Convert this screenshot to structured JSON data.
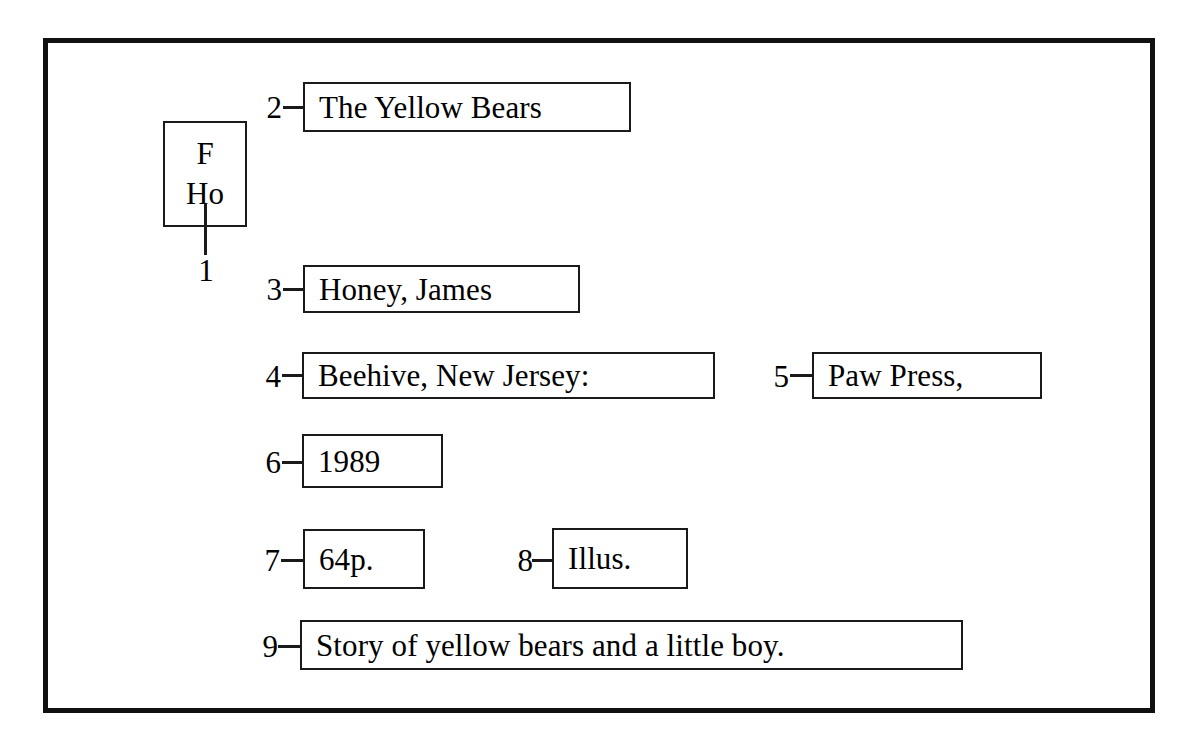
{
  "diagram": {
    "type": "catalog-card-parts",
    "call_number_box": {
      "lines": [
        "F",
        "Ho"
      ],
      "callout": "1"
    },
    "fields": [
      {
        "callout": "2",
        "text": "The Yellow Bears",
        "left": 303,
        "top": 82,
        "width": 328,
        "height": 50,
        "num_left": 252,
        "num_top": 92,
        "dash_left": 283,
        "dash_top": 106,
        "dash_width": 22
      },
      {
        "callout": "3",
        "text": "Honey, James",
        "left": 303,
        "top": 265,
        "width": 277,
        "height": 48,
        "num_left": 252,
        "num_top": 274,
        "dash_left": 283,
        "dash_top": 288,
        "dash_width": 22
      },
      {
        "callout": "4",
        "text": "Beehive, New Jersey:",
        "left": 302,
        "top": 352,
        "width": 413,
        "height": 47,
        "num_left": 251,
        "num_top": 361,
        "dash_left": 282,
        "dash_top": 374,
        "dash_width": 22
      },
      {
        "callout": "5",
        "text": "Paw Press,",
        "left": 812,
        "top": 352,
        "width": 230,
        "height": 47,
        "num_left": 759,
        "num_top": 361,
        "dash_left": 790,
        "dash_top": 374,
        "dash_width": 24
      },
      {
        "callout": "6",
        "text": "1989",
        "left": 302,
        "top": 434,
        "width": 141,
        "height": 54,
        "num_left": 251,
        "num_top": 447,
        "dash_left": 282,
        "dash_top": 461,
        "dash_width": 22
      },
      {
        "callout": "7",
        "text": "64p.",
        "left": 303,
        "top": 529,
        "width": 122,
        "height": 60,
        "num_left": 250,
        "num_top": 545,
        "dash_left": 281,
        "dash_top": 559,
        "dash_width": 24
      },
      {
        "callout": "8",
        "text": "Illus.",
        "left": 552,
        "top": 528,
        "width": 136,
        "height": 61,
        "num_left": 503,
        "num_top": 545,
        "dash_left": 532,
        "dash_top": 559,
        "dash_width": 22
      },
      {
        "callout": "9",
        "text": "Story of yellow bears and a little boy.",
        "left": 300,
        "top": 620,
        "width": 663,
        "height": 50,
        "num_left": 248,
        "num_top": 631,
        "dash_left": 278,
        "dash_top": 645,
        "dash_width": 24
      }
    ]
  },
  "colors": {
    "ink": "#000000",
    "frame": "#111111",
    "box_border": "#1a1a1a",
    "paper": "#ffffff"
  }
}
